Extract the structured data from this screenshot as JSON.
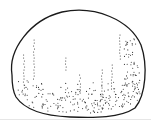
{
  "figure": {
    "outline_color": "#1a1a1a",
    "stipple_color": "#333333",
    "background": "#ffffff",
    "rule_color": "#e6e6e6"
  }
}
